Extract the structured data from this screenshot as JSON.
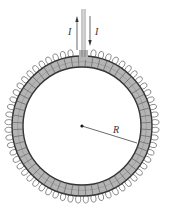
{
  "diagram": {
    "type": "toroidal-solenoid",
    "labels": {
      "current_in": "I",
      "current_out": "I",
      "radius": "R"
    },
    "geometry": {
      "center": [
        82,
        126
      ],
      "outer_radius": 70,
      "inner_radius": 59,
      "turns": 60
    },
    "colors": {
      "core_fill": "#b4b4b4",
      "core_edge": "#333333",
      "wire": "#555555",
      "lead": "#777777"
    }
  }
}
